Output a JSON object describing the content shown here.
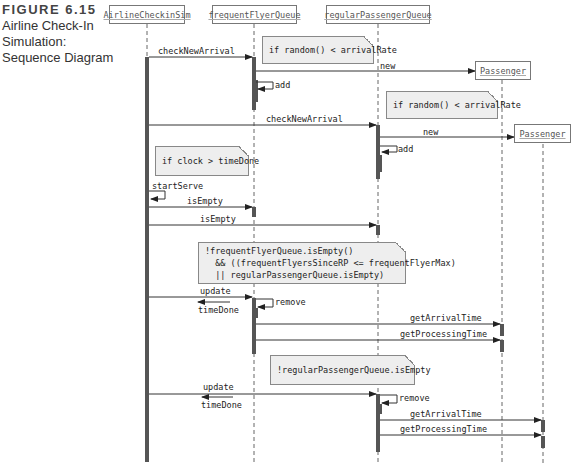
{
  "caption": {
    "figure": "FIGURE 6.15",
    "lines": [
      "Airline Check-In",
      "Simulation:",
      "Sequence Diagram"
    ]
  },
  "objects": [
    {
      "name": "AirlineCheckinSim"
    },
    {
      "name": "frequentFlyerQueue"
    },
    {
      "name": "regularPassengerQueue"
    },
    {
      "name": "Passenger"
    },
    {
      "name": "Passenger"
    }
  ],
  "notes": [
    {
      "text": "if random() < arrivalRate"
    },
    {
      "text": "if random() < arrivalRate"
    },
    {
      "text": "if clock > timeDone"
    },
    {
      "text": "!frequentFlyerQueue.isEmpty()\n  && ((frequentFlyersSinceRP <= frequentFlyerMax)\n  || regularPassengerQueue.isEmpty)"
    },
    {
      "text": "!regularPassengerQueue.isEmpty"
    }
  ],
  "messages": [
    {
      "label": "checkNewArrival",
      "from": "AirlineCheckinSim",
      "to": "frequentFlyerQueue"
    },
    {
      "label": "new",
      "from": "frequentFlyerQueue",
      "to": "Passenger"
    },
    {
      "label": "add",
      "from": "frequentFlyerQueue",
      "to": "frequentFlyerQueue"
    },
    {
      "label": "checkNewArrival",
      "from": "AirlineCheckinSim",
      "to": "regularPassengerQueue"
    },
    {
      "label": "new",
      "from": "regularPassengerQueue",
      "to": "Passenger"
    },
    {
      "label": "add",
      "from": "regularPassengerQueue",
      "to": "regularPassengerQueue"
    },
    {
      "label": "startServe",
      "from": "AirlineCheckinSim",
      "to": "AirlineCheckinSim"
    },
    {
      "label": "isEmpty",
      "from": "AirlineCheckinSim",
      "to": "frequentFlyerQueue"
    },
    {
      "label": "isEmpty",
      "from": "AirlineCheckinSim",
      "to": "regularPassengerQueue"
    },
    {
      "label": "update",
      "from": "AirlineCheckinSim",
      "to": "frequentFlyerQueue"
    },
    {
      "label": "timeDone",
      "from": "frequentFlyerQueue",
      "to": "AirlineCheckinSim"
    },
    {
      "label": "remove",
      "from": "frequentFlyerQueue",
      "to": "frequentFlyerQueue"
    },
    {
      "label": "getArrivalTime",
      "from": "frequentFlyerQueue",
      "to": "Passenger"
    },
    {
      "label": "getProcessingTime",
      "from": "frequentFlyerQueue",
      "to": "Passenger"
    },
    {
      "label": "update",
      "from": "AirlineCheckinSim",
      "to": "regularPassengerQueue"
    },
    {
      "label": "timeDone",
      "from": "regularPassengerQueue",
      "to": "AirlineCheckinSim"
    },
    {
      "label": "remove",
      "from": "regularPassengerQueue",
      "to": "regularPassengerQueue"
    },
    {
      "label": "getArrivalTime",
      "from": "regularPassengerQueue",
      "to": "Passenger"
    },
    {
      "label": "getProcessingTime",
      "from": "regularPassengerQueue",
      "to": "Passenger"
    }
  ],
  "colors": {
    "line": "#444444",
    "activation": "#555555",
    "note_fill": "#eeeeee"
  }
}
